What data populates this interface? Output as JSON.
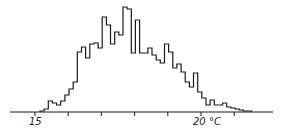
{
  "chart_data": {
    "type": "bar",
    "subtype": "step-histogram",
    "title": "",
    "xlabel": "°C",
    "ylabel": "",
    "x_ticks": [
      15,
      16,
      17,
      18,
      19,
      20,
      21
    ],
    "x_tick_labels": [
      {
        "value": 15,
        "label": "15"
      },
      {
        "value": 20,
        "label": "20 °C"
      }
    ],
    "xlim": [
      14.8,
      22.8
    ],
    "grid": false,
    "legend": null,
    "bin_width": 0.125,
    "bin_start": 15.15,
    "values": [
      1,
      3,
      11,
      9,
      7,
      11,
      17,
      23,
      30,
      60,
      65,
      54,
      68,
      69,
      64,
      95,
      87,
      68,
      80,
      77,
      105,
      103,
      59,
      92,
      59,
      59,
      64,
      57,
      52,
      49,
      68,
      60,
      44,
      48,
      40,
      30,
      25,
      39,
      20,
      14,
      7,
      12,
      7,
      7,
      9,
      5,
      4,
      3,
      2,
      1,
      1
    ],
    "value_units": "relative frequency (arbitrary, read from pixel heights)"
  },
  "axis": {
    "label_15": "15",
    "label_20": "20 °C"
  },
  "style": {
    "line_color": "#1a1a1a",
    "background": "#ffffff"
  }
}
